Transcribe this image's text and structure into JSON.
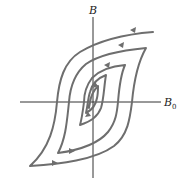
{
  "diagram": {
    "axes": {
      "y_label": "B",
      "x_label": "B",
      "x_label_subscript": "0"
    },
    "colors": {
      "axis": "#333333",
      "curve": "#6e6e6e",
      "background": "#ffffff"
    },
    "loops": [
      {
        "name": "outer",
        "tip_top_right": [
          153,
          32
        ],
        "tip_bottom_left": [
          30,
          166
        ]
      },
      {
        "name": "second",
        "tip_top_right": [
          146,
          48
        ],
        "tip_bottom_left": [
          58,
          153
        ]
      },
      {
        "name": "third",
        "tip_top_right": [
          125,
          65
        ],
        "tip_bottom_left": [
          80,
          125
        ]
      },
      {
        "name": "fourth",
        "tip_top_right": [
          106,
          75
        ],
        "tip_bottom_left": [
          84,
          113
        ]
      },
      {
        "name": "innermost",
        "tip_top_right": [
          98,
          86
        ],
        "tip_bottom_left": [
          89,
          108
        ]
      }
    ],
    "arrow_count": 7
  }
}
